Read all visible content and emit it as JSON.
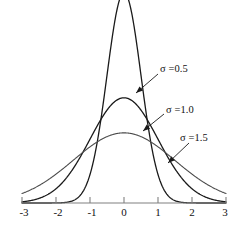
{
  "chart_data": {
    "type": "line",
    "title": "",
    "xlabel": "",
    "ylabel": "",
    "xlim": [
      -3,
      3
    ],
    "ylim": [
      0,
      0.8
    ],
    "grid": false,
    "legend_position": "inline-annotations",
    "x_ticks": [
      "-3",
      "-2",
      "-1",
      "0",
      "1",
      "2",
      "3"
    ],
    "x_tick_values": [
      -3,
      -2,
      -1,
      0,
      1,
      2,
      3
    ],
    "y_ticks": [],
    "series": [
      {
        "name": "sigma-0.5",
        "label": "σ =0.5",
        "sigma": 0.5,
        "mu": 0,
        "peak_value": 0.798,
        "color": "#1a1a1a",
        "x": [
          -3,
          -2.5,
          -2,
          -1.5,
          -1.25,
          -1,
          -0.75,
          -0.5,
          -0.25,
          0,
          0.25,
          0.5,
          0.75,
          1,
          1.25,
          1.5,
          2,
          2.5,
          3
        ],
        "y": [
          0.0,
          0.0001,
          0.0003,
          0.0089,
          0.0308,
          0.108,
          0.2516,
          0.4839,
          0.7041,
          0.7979,
          0.7041,
          0.4839,
          0.2516,
          0.108,
          0.0308,
          0.0089,
          0.0003,
          0.0001,
          0.0
        ]
      },
      {
        "name": "sigma-1.0",
        "label": "σ =1.0",
        "sigma": 1.0,
        "mu": 0,
        "peak_value": 0.399,
        "color": "#1a1a1a",
        "x": [
          -3,
          -2.5,
          -2,
          -1.5,
          -1.25,
          -1,
          -0.75,
          -0.5,
          -0.25,
          0,
          0.25,
          0.5,
          0.75,
          1,
          1.25,
          1.5,
          2,
          2.5,
          3
        ],
        "y": [
          0.0044,
          0.0175,
          0.054,
          0.1295,
          0.1826,
          0.242,
          0.3011,
          0.3521,
          0.3867,
          0.3989,
          0.3867,
          0.3521,
          0.3011,
          0.242,
          0.1826,
          0.1295,
          0.054,
          0.0175,
          0.0044
        ]
      },
      {
        "name": "sigma-1.5",
        "label": "σ =1.5",
        "sigma": 1.5,
        "mu": 0,
        "peak_value": 0.266,
        "color": "#4a4a4a",
        "x": [
          -3,
          -2.5,
          -2,
          -1.5,
          -1.25,
          -1,
          -0.75,
          -0.5,
          -0.25,
          0,
          0.25,
          0.5,
          0.75,
          1,
          1.25,
          1.5,
          2,
          2.5,
          3
        ],
        "y": [
          0.036,
          0.0655,
          0.1093,
          0.1616,
          0.188,
          0.213,
          0.2344,
          0.2516,
          0.262,
          0.266,
          0.262,
          0.2516,
          0.2344,
          0.213,
          0.188,
          0.1616,
          0.1093,
          0.0655,
          0.036
        ]
      }
    ],
    "annotations": [
      {
        "text": "σ =0.5",
        "label_x": 160,
        "label_y": 63,
        "arrow_from_x": 158,
        "arrow_from_y": 74,
        "arrow_to_x": 136,
        "arrow_to_y": 93
      },
      {
        "text": "σ =1.0",
        "label_x": 166,
        "label_y": 104,
        "arrow_from_x": 164,
        "arrow_from_y": 114,
        "arrow_to_x": 143,
        "arrow_to_y": 131
      },
      {
        "text": "σ =1.5",
        "label_x": 180,
        "label_y": 132,
        "arrow_from_x": 189,
        "arrow_from_y": 143,
        "arrow_to_x": 168,
        "arrow_to_y": 163
      }
    ],
    "axis": {
      "baseline_y": 203,
      "left_x": 22,
      "right_x": 226,
      "color": "#808080",
      "tick_color": "#808080",
      "tick_length": 6
    }
  },
  "tick_labels": [
    {
      "text": "-3",
      "x": 24,
      "y": 206
    },
    {
      "text": "-2",
      "x": 58,
      "y": 206
    },
    {
      "text": "-1",
      "x": 92,
      "y": 206
    },
    {
      "text": "0",
      "x": 124,
      "y": 206
    },
    {
      "text": "1",
      "x": 158,
      "y": 206
    },
    {
      "text": "2",
      "x": 192,
      "y": 206
    },
    {
      "text": "3",
      "x": 225,
      "y": 206
    }
  ]
}
